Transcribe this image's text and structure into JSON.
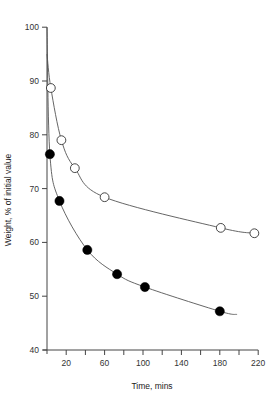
{
  "chart_data": {
    "type": "scatter",
    "title": "",
    "xlabel": "Time, mins",
    "ylabel": "Weight, % of initial value",
    "xlim": [
      0,
      220
    ],
    "ylim": [
      40,
      100
    ],
    "x_ticks": [
      0,
      20,
      40,
      60,
      80,
      100,
      120,
      140,
      160,
      180,
      200,
      220
    ],
    "x_tick_labels": [
      "20",
      "60",
      "100",
      "140",
      "180",
      "220"
    ],
    "x_tick_label_values": [
      20,
      60,
      100,
      140,
      180,
      220
    ],
    "y_ticks": [
      40,
      50,
      60,
      70,
      80,
      90,
      100
    ],
    "y_tick_labels": [
      "40",
      "50",
      "60",
      "70",
      "80",
      "90",
      "100"
    ],
    "grid": false,
    "legend": null,
    "series": [
      {
        "name": "open-circles",
        "marker": "open-circle",
        "x": [
          4,
          15,
          29,
          60,
          181,
          216
        ],
        "values": [
          88.7,
          79.0,
          73.8,
          68.4,
          62.7,
          61.7
        ],
        "fit_curve": {
          "x_start": 0,
          "y_start": 95,
          "x_end": 216,
          "y_end": 61.5
        }
      },
      {
        "name": "filled-circles",
        "marker": "filled-circle",
        "x": [
          3,
          13,
          42,
          73,
          102,
          180
        ],
        "values": [
          76.4,
          67.7,
          58.6,
          54.1,
          51.7,
          47.2
        ],
        "fit_curve": {
          "x_start": 0,
          "y_start": 100,
          "x_end": 198,
          "y_end": 46.6
        }
      }
    ],
    "colors": {
      "axis": "#444444",
      "curve": "#555555",
      "marker_fill": "#000000",
      "marker_open_fill": "#ffffff"
    }
  }
}
